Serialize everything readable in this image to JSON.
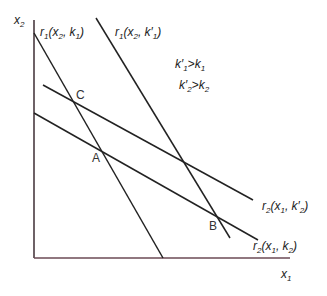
{
  "axes": {
    "y_label": "x",
    "y_label_sub": "2",
    "x_label": "x",
    "x_label_sub": "1",
    "axis_color": "#6b4a55"
  },
  "curves": [
    {
      "id": "r1_k1",
      "label_fn": "r",
      "label_fn_sub": "1",
      "label_args": "(x",
      "label_args_sub": "2",
      "label_tail": ", k",
      "label_tail_sub": "1",
      "label_end": ")",
      "x1": 34,
      "y1": 33,
      "x2": 163,
      "y2": 258
    },
    {
      "id": "r1_k1p",
      "label_fn": "r",
      "label_fn_sub": "1",
      "label_args": "(x",
      "label_args_sub": "2",
      "label_tail": ", k′",
      "label_tail_sub": "1",
      "label_end": ")",
      "x1": 96,
      "y1": 18,
      "x2": 230,
      "y2": 238
    },
    {
      "id": "r2_k2p",
      "label_fn": "r",
      "label_fn_sub": "2",
      "label_args": "(x",
      "label_args_sub": "1",
      "label_tail": ", k′",
      "label_tail_sub": "2",
      "label_end": ")",
      "x1": 43,
      "y1": 85,
      "x2": 253,
      "y2": 200
    },
    {
      "id": "r2_k2",
      "label_fn": "r",
      "label_fn_sub": "2",
      "label_args": "(x",
      "label_args_sub": "1",
      "label_tail": ", k",
      "label_tail_sub": "2",
      "label_end": ")",
      "x1": 34,
      "y1": 113,
      "x2": 258,
      "y2": 240
    }
  ],
  "points": {
    "C": "C",
    "A": "A",
    "B": "B"
  },
  "conditions": {
    "line1_a": "k′",
    "line1_a_sub": "1",
    "line1_op": ">",
    "line1_b": "k",
    "line1_b_sub": "1",
    "line2_a": "k′",
    "line2_a_sub": "2",
    "line2_op": ">",
    "line2_b": "k",
    "line2_b_sub": "2"
  },
  "line_color": "#222222"
}
